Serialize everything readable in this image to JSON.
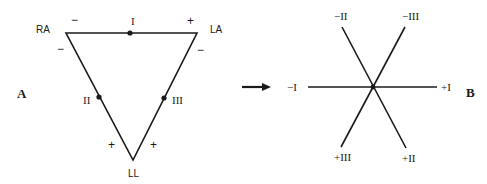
{
  "colors": {
    "ink": "#1a1a1a",
    "background": "#ffffff"
  },
  "panel_a": {
    "label": "A",
    "vertices": {
      "ra": "RA",
      "la": "LA",
      "ll": "LL"
    },
    "lead_labels": {
      "i": "I",
      "ii": "II",
      "iii": "III"
    },
    "polarity": {
      "lead_i_ra": "−",
      "lead_i_la": "+",
      "lead_ii_ra": "−",
      "lead_iii_la": "−",
      "lead_ii_ll": "+",
      "lead_iii_ll": "+"
    }
  },
  "arrow": {
    "icon": "right-arrow-icon"
  },
  "panel_b": {
    "label": "B",
    "axis_labels": {
      "neg_i": "−I",
      "pos_i": "+I",
      "neg_ii": "−II",
      "pos_ii": "+II",
      "neg_iii": "−III",
      "pos_iii": "+III"
    }
  }
}
